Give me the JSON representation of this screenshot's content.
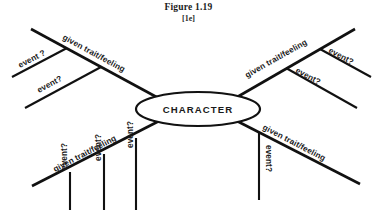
{
  "figure": {
    "title": "Figure 1.19",
    "subtitle": "[1e]",
    "center_label": "CHARACTER",
    "ink_color": "#111111",
    "background_color": "#ffffff"
  },
  "branches": [
    {
      "id": "top-left",
      "label": "given trait/feeling",
      "events": [
        {
          "label": "event ?"
        },
        {
          "label": "event?"
        }
      ]
    },
    {
      "id": "top-right",
      "label": "given trait/feeling",
      "events": [
        {
          "label": "event?"
        },
        {
          "label": "event?"
        }
      ]
    },
    {
      "id": "bottom-left",
      "label": "given trait/feeling",
      "events": [
        {
          "label": "event?"
        },
        {
          "label": "event?"
        },
        {
          "label": "event?"
        }
      ]
    },
    {
      "id": "bottom-right",
      "label": "given trait/feeling",
      "events": [
        {
          "label": "event?"
        }
      ]
    }
  ]
}
